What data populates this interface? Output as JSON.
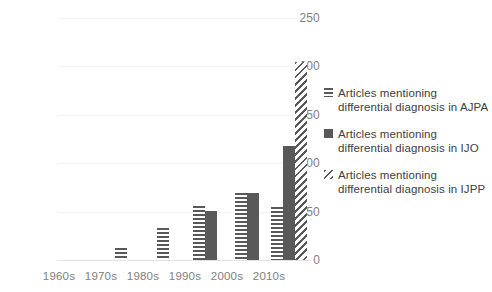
{
  "chart_data": {
    "type": "bar",
    "title": "",
    "xlabel": "",
    "ylabel": "",
    "ylim": [
      0,
      250
    ],
    "yticks": [
      0,
      50,
      100,
      150,
      200,
      250
    ],
    "grid": true,
    "legend_position": "right",
    "categories": [
      "1960s",
      "1970s",
      "1980s",
      "1990s",
      "2000s",
      "2010s"
    ],
    "series": [
      {
        "name": "Articles mentioning differential diagnosis in AJPA",
        "pattern": "horizontal-stripes",
        "color": "#595959",
        "values": [
          0,
          13,
          35,
          59,
          73,
          58
        ]
      },
      {
        "name": "Articles mentioning differential diagnosis in IJO",
        "pattern": "solid",
        "color": "#595959",
        "values": [
          0,
          0,
          0,
          54,
          74,
          125
        ]
      },
      {
        "name": "Articles mentioning differential diagnosis in IJPP",
        "pattern": "diagonal-stripes",
        "color": "#595959",
        "values": [
          0,
          0,
          0,
          0,
          0,
          217
        ]
      }
    ]
  },
  "axis": {
    "y_tick_labels": [
      "250",
      "200",
      "150",
      "100",
      "50",
      "0"
    ],
    "x_tick_labels": [
      "1960s",
      "1970s",
      "1980s",
      "1990s",
      "2000s",
      "2010s"
    ]
  },
  "legend": {
    "items": [
      {
        "label": "Articles mentioning differential diagnosis in AJPA",
        "swatch": "horizontal-stripes-swatch"
      },
      {
        "label": "Articles mentioning differential diagnosis in IJO",
        "swatch": "solid-square-swatch"
      },
      {
        "label": "Articles mentioning differential diagnosis in IJPP",
        "swatch": "diagonal-stripes-swatch"
      }
    ]
  }
}
